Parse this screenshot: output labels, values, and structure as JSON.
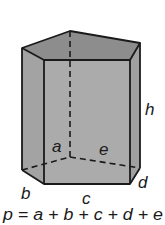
{
  "figure": {
    "labels": {
      "a": "a",
      "b": "b",
      "c": "c",
      "d": "d",
      "e": "e",
      "h": "h"
    },
    "formula": "p = a + b + c + d + e",
    "colors": {
      "top_face": "#8f8f8f",
      "side_faces": "#a6a6a6",
      "front_face": "#ababab",
      "edges": "#1a1a1a"
    }
  }
}
